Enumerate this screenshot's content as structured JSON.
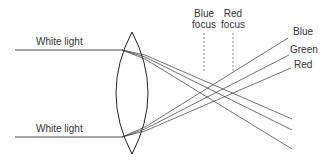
{
  "diagram": {
    "labels": {
      "top_input": "White light",
      "bottom_input": "White light",
      "blue_focus_line1": "Blue",
      "blue_focus_line2": "focus",
      "red_focus_line1": "Red",
      "red_focus_line2": "focus",
      "ray_blue": "Blue",
      "ray_green": "Green",
      "ray_red": "Red"
    },
    "colors": {
      "line": "#333333",
      "background": "#ffffff"
    }
  }
}
